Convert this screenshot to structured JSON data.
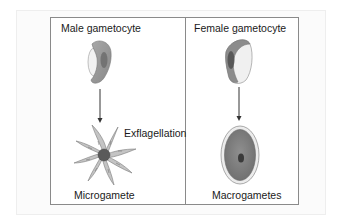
{
  "figure": {
    "panels": [
      {
        "id": "male",
        "title": "Male gametocyte",
        "process_label": "Exflagellation",
        "result_label": "Microgamete"
      },
      {
        "id": "female",
        "title": "Female gametocyte",
        "result_label": "Macrogametes"
      }
    ]
  },
  "colors": {
    "border": "#8a8a8a",
    "cell_body": "#9a9a9a",
    "cell_dark": "#5c5c5c",
    "cell_light": "#f0f0f0",
    "arrow": "#333333",
    "flagella": "#bdbdbd",
    "nucleus": "#4a4a4a"
  }
}
